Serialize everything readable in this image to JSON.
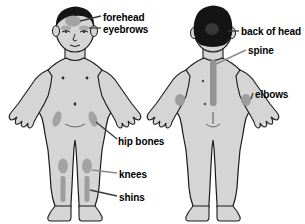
{
  "diagram": {
    "background_color": "#ffffff",
    "figures": [
      {
        "id": "front-view",
        "view": "front",
        "hair_color": "#141414",
        "skin_fill": "#d5d5d5",
        "outline_color": "#1a1a1a",
        "highlight_color": "#a0a0a0"
      },
      {
        "id": "back-view",
        "view": "back",
        "hair_color": "#141414",
        "skin_fill": "#d5d5d5",
        "outline_color": "#1a1a1a",
        "highlight_color": "#a0a0a0"
      }
    ],
    "labels": [
      {
        "id": "forehead",
        "text": "forehead",
        "figure": "front",
        "region": "forehead"
      },
      {
        "id": "eyebrows",
        "text": "eyebrows",
        "figure": "front",
        "region": "eyebrows"
      },
      {
        "id": "hip-bones",
        "text": "hip bones",
        "figure": "front",
        "region": "hip-bones"
      },
      {
        "id": "knees",
        "text": "knees",
        "figure": "front",
        "region": "knees"
      },
      {
        "id": "shins",
        "text": "shins",
        "figure": "front",
        "region": "shins"
      },
      {
        "id": "back-of-head",
        "text": "back of head",
        "figure": "back",
        "region": "back-of-head"
      },
      {
        "id": "spine",
        "text": "spine",
        "figure": "back",
        "region": "spine"
      },
      {
        "id": "elbows",
        "text": "elbows",
        "figure": "back",
        "region": "elbows"
      }
    ],
    "colors": {
      "skin": "#d5d5d5",
      "hair": "#141414",
      "highlight": "#a0a0a0",
      "outline": "#1a1a1a",
      "leader_line": "#3a3a3a",
      "text": "#000000"
    }
  }
}
